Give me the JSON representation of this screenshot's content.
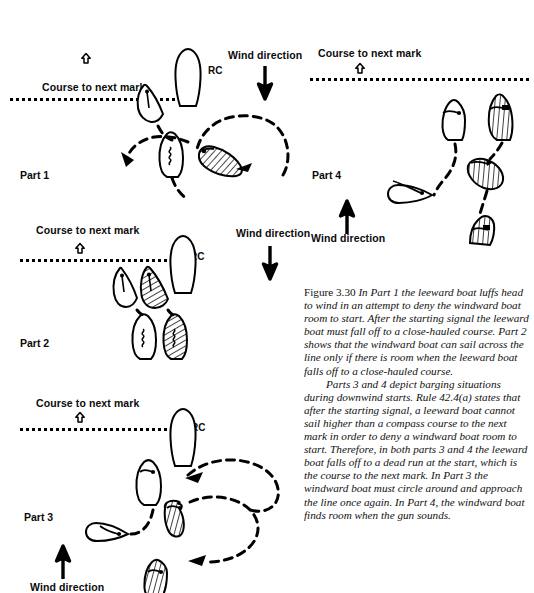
{
  "figure": {
    "number_label": "Figure 3.30",
    "caption_paragraph_1": "In Part 1 the leeward boat luffs head to wind in an attempt to deny the windward boat room to start. After the starting signal the leeward boat must fall off to a close-hauled course. Part 2 shows that the windward boat can sail across the line only if there is room when the leeward boat falls off to a close-hauled course.",
    "caption_paragraph_2": "Parts 3 and 4 depict barging situations during downwind starts. Rule 42.4(a) states that after the starting signal, a leeward boat cannot sail higher than a compass course to the next mark in order to deny a windward boat room to start. Therefore, in both parts 3 and 4 the leeward boat falls off to a dead run at the start, which is the course to the next mark. In Part 3 the windward boat must circle around and approach the line once again. In Part 4, the windward boat finds room when the gun sounds."
  },
  "ink_color": "#000000",
  "paper_color": "#ffffff",
  "hatch_color": "#1a1a1a",
  "panels": [
    {
      "id": "part1",
      "part_label": "Part 1",
      "course_label": "Course to next mark",
      "wind_label": "Wind direction",
      "wind_arrow_direction": "down",
      "rc_label": "RC",
      "course_mark_icon": "up-arrow-outline-icon"
    },
    {
      "id": "part2",
      "part_label": "Part 2",
      "course_label": "Course to next mark",
      "wind_label": "Wind direction",
      "wind_arrow_direction": "down",
      "rc_label": "RC",
      "course_mark_icon": "up-arrow-outline-icon"
    },
    {
      "id": "part3",
      "part_label": "Part 3",
      "course_label": "Course to next mark",
      "wind_label": "Wind direction",
      "wind_arrow_direction": "up",
      "rc_label": "RC",
      "course_mark_icon": "up-arrow-outline-icon"
    },
    {
      "id": "part4",
      "part_label": "Part 4",
      "course_label": "Course to next mark",
      "wind_label": "Wind direction",
      "wind_arrow_direction": "up",
      "rc_label": "",
      "course_mark_icon": "up-arrow-outline-icon"
    }
  ]
}
